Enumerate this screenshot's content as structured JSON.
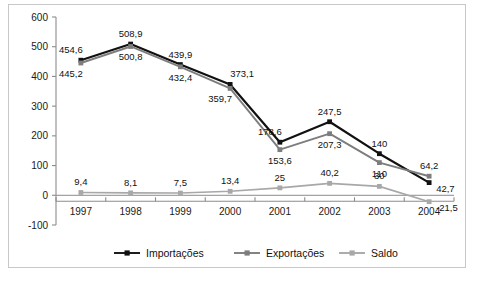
{
  "chart_data": {
    "type": "line",
    "title": "",
    "xlabel": "",
    "ylabel": "",
    "categories": [
      "1997",
      "1998",
      "1999",
      "2000",
      "2001",
      "2002",
      "2003",
      "2004"
    ],
    "ylim": [
      -100,
      600
    ],
    "yticks": [
      -100,
      0,
      100,
      200,
      300,
      400,
      500,
      600
    ],
    "ytick_labels": [
      "-100",
      "0",
      "100",
      "200",
      "300",
      "400",
      "500",
      "600"
    ],
    "grid": false,
    "legend_position": "bottom",
    "decimal_separator": ",",
    "series": [
      {
        "name": "Importações",
        "color": "#111111",
        "marker": "square",
        "values": [
          454.6,
          508.9,
          439.9,
          373.1,
          178.6,
          247.5,
          140,
          42.7
        ],
        "labels": [
          "454,6",
          "508,9",
          "439,9",
          "373,1",
          "178,6",
          "247,5",
          "140",
          "42,7"
        ],
        "label_positions": [
          "above-left",
          "above",
          "above",
          "above-right",
          "above-left",
          "above",
          "above",
          "right-below"
        ]
      },
      {
        "name": "Exportações",
        "color": "#7d7d7d",
        "marker": "square",
        "values": [
          445.2,
          500.8,
          432.4,
          359.7,
          153.6,
          207.3,
          110,
          64.2
        ],
        "labels": [
          "445,2",
          "500,8",
          "432,4",
          "359,7",
          "153,6",
          "207,3",
          "110",
          "64,2"
        ],
        "label_positions": [
          "below-left",
          "below",
          "below",
          "below-left",
          "below",
          "below",
          "below",
          "above"
        ]
      },
      {
        "name": "Saldo",
        "color": "#a8a8a8",
        "marker": "square",
        "values": [
          9.4,
          8.1,
          7.5,
          13.4,
          25,
          40.2,
          30,
          -21.5
        ],
        "labels": [
          "9,4",
          "8,1",
          "7,5",
          "13,4",
          "25",
          "40,2",
          "30",
          "-21,5"
        ],
        "label_positions": [
          "above",
          "above",
          "above",
          "above",
          "above",
          "above",
          "above",
          "right-below"
        ]
      }
    ]
  },
  "legend": {
    "items": [
      {
        "label": "Importações",
        "color": "#111111"
      },
      {
        "label": "Exportações",
        "color": "#7d7d7d"
      },
      {
        "label": "Saldo",
        "color": "#a8a8a8"
      }
    ]
  }
}
